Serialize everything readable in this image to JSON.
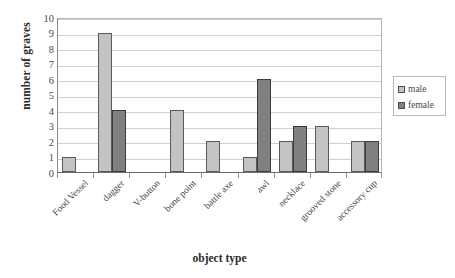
{
  "chart_data": {
    "type": "bar",
    "title": "",
    "subtitle": "",
    "xlabel": "object type",
    "ylabel": "number of graves",
    "ylim": [
      0,
      10
    ],
    "yticks": [
      0,
      1,
      2,
      3,
      4,
      5,
      6,
      7,
      8,
      9,
      10
    ],
    "ytick_labels": [
      "0",
      "1",
      "2",
      "3",
      "4",
      "5",
      "6",
      "7",
      "8",
      "9",
      "10"
    ],
    "grid": true,
    "grid_axis": "y",
    "legend_position": "right",
    "bar_mode": "grouped",
    "categories": [
      "Food Vessel",
      "dagger",
      "V-button",
      "bone point",
      "battle axe",
      "awl",
      "necklace",
      "grooved stone",
      "accessory cup"
    ],
    "series": [
      {
        "name": "male",
        "color": "#c3c3c3",
        "values": [
          1,
          9,
          0,
          4,
          2,
          1,
          2,
          3,
          2
        ]
      },
      {
        "name": "female",
        "color": "#808080",
        "values": [
          0,
          4,
          0,
          0,
          0,
          6,
          3,
          0,
          2
        ]
      }
    ],
    "annotations": []
  },
  "legend": {
    "items": [
      {
        "label": "male"
      },
      {
        "label": "female"
      }
    ]
  },
  "colors": {
    "male": "#c3c3c3",
    "female": "#808080",
    "grid": "#d0d0d0",
    "axis": "#6d6d6d",
    "text": "#4a4a4a"
  }
}
